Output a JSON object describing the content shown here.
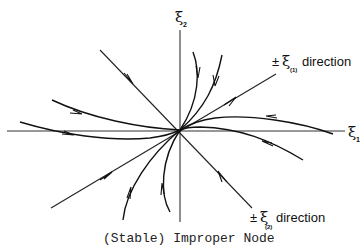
{
  "figure": {
    "caption": "(Stable) Improper Node",
    "axes": {
      "horizontal": {
        "symbol": "ξ",
        "subscript": "1"
      },
      "vertical": {
        "symbol": "ξ",
        "subscript": "2"
      }
    },
    "eigen_directions": [
      {
        "prefix": "±",
        "symbol": "ξ",
        "subscript": "(1)",
        "suffix": "direction"
      },
      {
        "prefix": "±",
        "symbol": "ξ",
        "subscript": "(2)",
        "suffix": "direction"
      }
    ],
    "node_type": "stable improper node",
    "colors": {
      "ink": "#111111",
      "background": "#ffffff"
    }
  }
}
